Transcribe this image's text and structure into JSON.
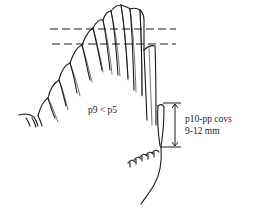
{
  "diagram": {
    "labels": {
      "comparison": "p9 < p5",
      "measure_line1": "p10-pp covs",
      "measure_line2": "9-12 mm"
    },
    "reference_lines": [
      "upper dashed line at p9 tip level",
      "lower dashed line at p10/p8 tip level"
    ],
    "colors": {
      "ink": "#1a1a1a",
      "background": "#ffffff"
    }
  }
}
